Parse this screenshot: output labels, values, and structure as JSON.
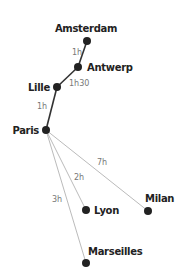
{
  "diagram": {
    "type": "train-route-network",
    "colors": {
      "node": "#222222",
      "main_line": "#333333",
      "secondary_line": "#bbbbbb",
      "edge_label": "#777777",
      "city_label": "#222222"
    },
    "nodes": [
      {
        "id": "amsterdam",
        "label": "Amsterdam"
      },
      {
        "id": "antwerp",
        "label": "Antwerp"
      },
      {
        "id": "lille",
        "label": "Lille"
      },
      {
        "id": "paris",
        "label": "Paris"
      },
      {
        "id": "lyon",
        "label": "Lyon"
      },
      {
        "id": "milan",
        "label": "Milan"
      },
      {
        "id": "marseilles",
        "label": "Marseilles"
      }
    ],
    "edges": [
      {
        "from": "amsterdam",
        "to": "antwerp",
        "label": "1h"
      },
      {
        "from": "antwerp",
        "to": "lille",
        "label": "1h30"
      },
      {
        "from": "lille",
        "to": "paris",
        "label": "1h"
      },
      {
        "from": "paris",
        "to": "milan",
        "label": "7h"
      },
      {
        "from": "paris",
        "to": "lyon",
        "label": "2h"
      },
      {
        "from": "paris",
        "to": "marseilles",
        "label": "3h"
      }
    ]
  }
}
